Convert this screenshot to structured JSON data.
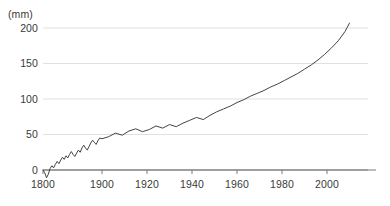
{
  "chart_data": {
    "type": "line",
    "title": "",
    "subtitle": "",
    "xlabel": "",
    "ylabel": "",
    "unit_label": "(mm)",
    "grid": true,
    "legend": false,
    "line_color": "#444444",
    "grid_color": "#d8d8d8",
    "axis_color": "#7a7a7a",
    "xlim": [
      1800,
      2010
    ],
    "ylim": [
      -15,
      215
    ],
    "x_ticks": [
      1800,
      1900,
      1920,
      1940,
      1960,
      1980,
      2000
    ],
    "x_tick_labels": [
      "1800",
      "1900",
      "1920",
      "1940",
      "1960",
      "1980",
      "2000"
    ],
    "y_ticks": [
      0,
      50,
      100,
      150,
      200
    ],
    "y_tick_labels": [
      "0",
      "50",
      "100",
      "150",
      "200"
    ],
    "x_axis_break": {
      "note": "1800-1900 compressed relative to 1900-2010",
      "segment_1_years": [
        1800,
        1900
      ],
      "segment_2_years": [
        1900,
        2010
      ]
    },
    "series": [
      {
        "name": "sea-level-rise",
        "x": [
          1800,
          1803,
          1806,
          1809,
          1812,
          1815,
          1818,
          1821,
          1824,
          1827,
          1830,
          1833,
          1836,
          1839,
          1842,
          1845,
          1848,
          1851,
          1854,
          1857,
          1860,
          1863,
          1866,
          1869,
          1872,
          1875,
          1878,
          1881,
          1884,
          1887,
          1890,
          1893,
          1896,
          1900,
          1903,
          1906,
          1909,
          1912,
          1915,
          1918,
          1921,
          1924,
          1927,
          1930,
          1933,
          1936,
          1939,
          1942,
          1945,
          1948,
          1951,
          1954,
          1957,
          1960,
          1963,
          1966,
          1969,
          1972,
          1975,
          1978,
          1981,
          1984,
          1987,
          1990,
          1993,
          1996,
          1999,
          2002,
          2005,
          2008,
          2010
        ],
        "y": [
          0,
          -4,
          -11,
          -6,
          2,
          6,
          3,
          8,
          12,
          9,
          14,
          18,
          15,
          20,
          17,
          22,
          26,
          22,
          19,
          24,
          28,
          25,
          31,
          35,
          31,
          28,
          33,
          38,
          42,
          39,
          36,
          41,
          45,
          44,
          47,
          52,
          49,
          55,
          58,
          54,
          57,
          62,
          59,
          64,
          61,
          66,
          70,
          74,
          71,
          77,
          82,
          86,
          90,
          95,
          99,
          104,
          108,
          112,
          117,
          121,
          126,
          131,
          136,
          142,
          148,
          155,
          163,
          172,
          182,
          195,
          207
        ]
      }
    ]
  }
}
